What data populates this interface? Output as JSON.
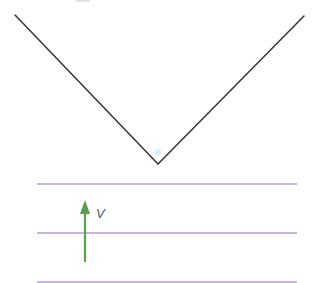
{
  "diagram": {
    "type": "physics-schematic",
    "colors": {
      "wedge": "#3a3a3a",
      "field_lines": "#b49ad6",
      "arrow": "#5a9e4e",
      "label": "#555555",
      "vertex_dot": "#bfe8ec"
    },
    "wedge": {
      "left_end": [
        15,
        15
      ],
      "vertex": [
        158,
        164
      ],
      "right_end": [
        304,
        16
      ]
    },
    "horizontal_lines": [
      {
        "y": 184,
        "x1": 37,
        "x2": 297
      },
      {
        "y": 233,
        "x1": 37,
        "x2": 297
      },
      {
        "y": 282,
        "x1": 37,
        "x2": 297
      }
    ],
    "arrow": {
      "x": 85,
      "y_tail": 262,
      "y_tip": 200,
      "direction": "up"
    },
    "label": {
      "text": "V",
      "x": 96,
      "y": 218
    }
  }
}
